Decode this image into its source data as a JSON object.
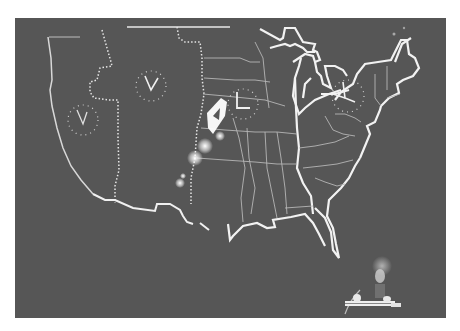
{
  "image": {
    "description": "Photograph of a projected map of the United States showing time zone boundaries and analog clocks, with a performer at a keyboard in the lower right",
    "background_color": "#565656",
    "line_color": "#f2f2f2"
  },
  "map": {
    "subject": "United States map with state outlines",
    "time_zone_boundaries": [
      "Pacific/Mountain",
      "Mountain/Central",
      "Central/Eastern"
    ],
    "clocks": [
      {
        "zone": "pacific",
        "glyph": "V"
      },
      {
        "zone": "mountain",
        "glyph": "V"
      },
      {
        "zone": "central",
        "glyph": "L"
      },
      {
        "zone": "eastern",
        "glyph": "Y"
      }
    ]
  }
}
